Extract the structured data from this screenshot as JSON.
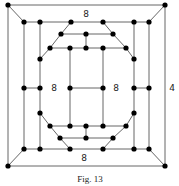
{
  "figure": {
    "caption": "Fig. 13",
    "labels": [
      {
        "id": "top-label",
        "text": "8",
        "x": 86,
        "y": 17
      },
      {
        "id": "left-inner-label",
        "text": "8",
        "x": 54,
        "y": 91
      },
      {
        "id": "right-inner-label",
        "text": "8",
        "x": 116,
        "y": 91
      },
      {
        "id": "outer-right-label",
        "text": "4",
        "x": 172,
        "y": 91
      },
      {
        "id": "bottom-label",
        "text": "8",
        "x": 84,
        "y": 161
      }
    ],
    "colors": {
      "edge": "#555555",
      "node": "#000000",
      "background": "#ffffff"
    }
  },
  "graph": {
    "nodes": [
      [
        8,
        5
      ],
      [
        165,
        5
      ],
      [
        8,
        166
      ],
      [
        165,
        166
      ],
      [
        24,
        22
      ],
      [
        40,
        22
      ],
      [
        71,
        22
      ],
      [
        103,
        22
      ],
      [
        134,
        22
      ],
      [
        149,
        22
      ],
      [
        61,
        34
      ],
      [
        86,
        34
      ],
      [
        113,
        34
      ],
      [
        50,
        48
      ],
      [
        70,
        48
      ],
      [
        86,
        48
      ],
      [
        103,
        48
      ],
      [
        126,
        48
      ],
      [
        40,
        59
      ],
      [
        134,
        59
      ],
      [
        24,
        88
      ],
      [
        40,
        88
      ],
      [
        70,
        88
      ],
      [
        103,
        88
      ],
      [
        134,
        88
      ],
      [
        149,
        88
      ],
      [
        40,
        113
      ],
      [
        134,
        113
      ],
      [
        50,
        126
      ],
      [
        70,
        126
      ],
      [
        86,
        126
      ],
      [
        103,
        126
      ],
      [
        126,
        126
      ],
      [
        60,
        138
      ],
      [
        86,
        138
      ],
      [
        113,
        138
      ],
      [
        24,
        149
      ],
      [
        40,
        149
      ],
      [
        70,
        149
      ],
      [
        103,
        149
      ],
      [
        134,
        149
      ],
      [
        149,
        149
      ]
    ],
    "edges": [
      [
        [
          8,
          5
        ],
        [
          165,
          5
        ]
      ],
      [
        [
          165,
          5
        ],
        [
          165,
          166
        ]
      ],
      [
        [
          165,
          166
        ],
        [
          8,
          166
        ]
      ],
      [
        [
          8,
          166
        ],
        [
          8,
          5
        ]
      ],
      [
        [
          8,
          5
        ],
        [
          24,
          22
        ]
      ],
      [
        [
          165,
          5
        ],
        [
          149,
          22
        ]
      ],
      [
        [
          8,
          166
        ],
        [
          24,
          149
        ]
      ],
      [
        [
          165,
          166
        ],
        [
          149,
          149
        ]
      ],
      [
        [
          24,
          22
        ],
        [
          149,
          22
        ]
      ],
      [
        [
          24,
          149
        ],
        [
          149,
          149
        ]
      ],
      [
        [
          24,
          22
        ],
        [
          24,
          149
        ]
      ],
      [
        [
          149,
          22
        ],
        [
          149,
          149
        ]
      ],
      [
        [
          40,
          22
        ],
        [
          40,
          59
        ]
      ],
      [
        [
          40,
          59
        ],
        [
          40,
          149
        ]
      ],
      [
        [
          134,
          22
        ],
        [
          134,
          59
        ]
      ],
      [
        [
          134,
          59
        ],
        [
          134,
          149
        ]
      ],
      [
        [
          24,
          88
        ],
        [
          40,
          88
        ]
      ],
      [
        [
          134,
          88
        ],
        [
          149,
          88
        ]
      ],
      [
        [
          71,
          22
        ],
        [
          61,
          34
        ]
      ],
      [
        [
          61,
          34
        ],
        [
          50,
          48
        ]
      ],
      [
        [
          50,
          48
        ],
        [
          40,
          59
        ]
      ],
      [
        [
          103,
          22
        ],
        [
          113,
          34
        ]
      ],
      [
        [
          113,
          34
        ],
        [
          126,
          48
        ]
      ],
      [
        [
          126,
          48
        ],
        [
          134,
          59
        ]
      ],
      [
        [
          61,
          34
        ],
        [
          113,
          34
        ]
      ],
      [
        [
          86,
          34
        ],
        [
          86,
          48
        ]
      ],
      [
        [
          50,
          48
        ],
        [
          126,
          48
        ]
      ],
      [
        [
          70,
          48
        ],
        [
          70,
          126
        ]
      ],
      [
        [
          103,
          48
        ],
        [
          103,
          126
        ]
      ],
      [
        [
          70,
          88
        ],
        [
          103,
          88
        ]
      ],
      [
        [
          40,
          113
        ],
        [
          50,
          126
        ]
      ],
      [
        [
          50,
          126
        ],
        [
          60,
          138
        ]
      ],
      [
        [
          60,
          138
        ],
        [
          70,
          149
        ]
      ],
      [
        [
          134,
          113
        ],
        [
          126,
          126
        ]
      ],
      [
        [
          126,
          126
        ],
        [
          113,
          138
        ]
      ],
      [
        [
          113,
          138
        ],
        [
          103,
          149
        ]
      ],
      [
        [
          50,
          126
        ],
        [
          126,
          126
        ]
      ],
      [
        [
          60,
          138
        ],
        [
          113,
          138
        ]
      ],
      [
        [
          86,
          126
        ],
        [
          86,
          138
        ]
      ]
    ]
  }
}
